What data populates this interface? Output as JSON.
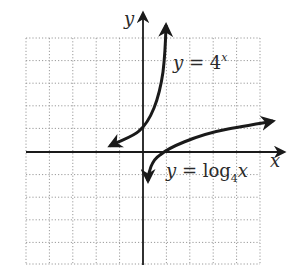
{
  "figure": {
    "axis_labels": {
      "x": "x",
      "y": "y"
    },
    "curves": [
      {
        "name": "exponential",
        "label_prefix": "y = 4",
        "label_sup": "x",
        "function": "y = 4^x"
      },
      {
        "name": "logarithmic",
        "label_prefix": "y = log",
        "label_sub": "4",
        "label_suffix": "x",
        "function": "y = log_4 x"
      }
    ],
    "grid": {
      "xmin": -5,
      "xmax": 5,
      "ymin": -5,
      "ymax": 5,
      "step": 1,
      "style": "dotted"
    },
    "colors": {
      "curve": "#1a1a1a",
      "axis": "#1a1a1a",
      "grid": "#9a9a9a",
      "text": "#2a2a2a"
    }
  }
}
